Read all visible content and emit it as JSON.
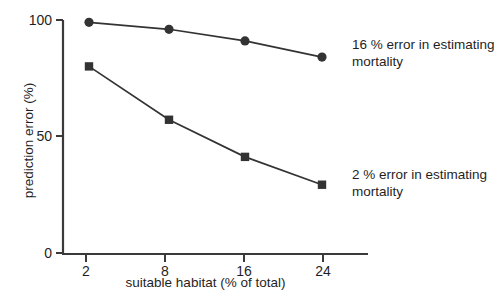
{
  "chart_data": {
    "type": "line",
    "title": "",
    "subtitle": "",
    "xlabel": "suitable habitat (% of total)",
    "ylabel": "prediction error (%)",
    "x": [
      2,
      8,
      16,
      24
    ],
    "categories": [
      "2",
      "8",
      "16",
      "24"
    ],
    "xtick_labels": [
      "2",
      "8",
      "16",
      "24"
    ],
    "ytick_labels": [
      "0",
      "50",
      "100"
    ],
    "yticks": [
      0,
      50,
      100
    ],
    "xlim": [
      0,
      27
    ],
    "ylim": [
      0,
      100
    ],
    "grid": false,
    "legend_position": "inline-annotation",
    "series": [
      {
        "name": "16 % error in estimating mortality",
        "marker": "circle",
        "color": "#333333",
        "values": [
          99,
          96,
          91,
          84
        ]
      },
      {
        "name": "2 % error in estimating mortality",
        "marker": "square",
        "color": "#333333",
        "values": [
          80,
          57,
          41,
          29
        ]
      }
    ],
    "annotations": [
      {
        "id": "upper",
        "line1": "16 % error in estimating",
        "line2": "mortality",
        "text": "16 % error in estimating mortality"
      },
      {
        "id": "lower",
        "line1": "2 % error in estimating",
        "line2": "mortality",
        "text": "2 % error in estimating mortality"
      }
    ]
  },
  "axes": {
    "y_title": "prediction error (%)",
    "x_title": "suitable habitat (% of total)",
    "y_tick_100": "100",
    "y_tick_50": "50",
    "y_tick_0": "0",
    "x_tick_2": "2",
    "x_tick_8": "8",
    "x_tick_16": "16",
    "x_tick_24": "24"
  },
  "annotations": {
    "upper_line1": "16 % error in estimating",
    "upper_line2": "mortality",
    "lower_line1": "2 % error in estimating",
    "lower_line2": "mortality"
  },
  "caption_remnant": "cut-off caption",
  "colors": {
    "ink": "#333333",
    "text": "#1f1f1f",
    "background": "#ffffff"
  }
}
